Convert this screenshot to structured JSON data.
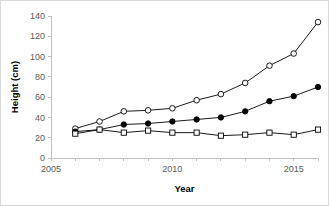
{
  "chart_data": {
    "type": "line",
    "title": "",
    "xlabel": "Year",
    "ylabel": "Height (cm)",
    "x": [
      2006,
      2007,
      2008,
      2009,
      2010,
      2011,
      2012,
      2013,
      2014,
      2015,
      2016
    ],
    "xlim": [
      2005,
      2016
    ],
    "ylim": [
      0,
      140
    ],
    "xticks": [
      2005,
      2006,
      2007,
      2008,
      2009,
      2010,
      2011,
      2012,
      2013,
      2014,
      2015,
      2016
    ],
    "xticklabels": [
      "2005",
      "",
      "",
      "",
      "",
      "2010",
      "",
      "",
      "",
      "",
      "2015",
      ""
    ],
    "yticks": [
      0,
      20,
      40,
      60,
      80,
      100,
      120,
      140
    ],
    "yticklabels": [
      "0",
      "20",
      "40",
      "60",
      "80",
      "100",
      "120",
      "140"
    ],
    "grid": false,
    "legend": "none",
    "series": [
      {
        "name": "open-circle-series",
        "marker": "open-circle",
        "values": [
          29,
          36,
          46,
          47,
          49,
          57,
          63,
          74,
          91,
          103,
          134
        ]
      },
      {
        "name": "filled-circle-series",
        "marker": "filled-circle",
        "values": [
          26,
          28,
          33,
          34,
          36,
          38,
          40,
          46,
          56,
          61,
          70
        ]
      },
      {
        "name": "open-square-series",
        "marker": "open-square",
        "values": [
          24,
          28,
          25,
          27,
          25,
          25,
          22,
          23,
          25,
          23,
          28
        ]
      }
    ]
  },
  "axes": {
    "y_label_text": "Height (cm)",
    "x_label_text": "Year"
  }
}
